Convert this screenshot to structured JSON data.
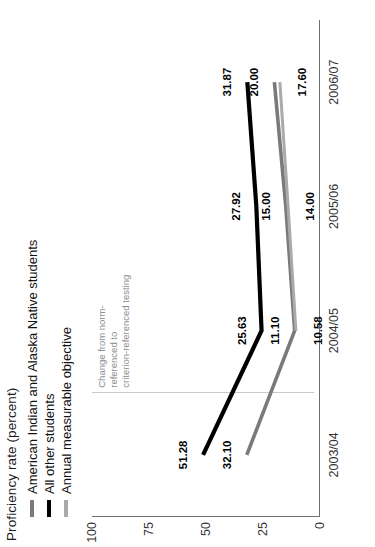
{
  "figure": {
    "title": "Proficiency rate (percent)"
  },
  "legend": {
    "position": "top-left",
    "items": [
      {
        "label": "American Indian and Alaska Native students",
        "color": "#7a7a7a",
        "swatch": "line-swatch"
      },
      {
        "label": "All other students",
        "color": "#000000",
        "swatch": "line-swatch"
      },
      {
        "label": "Annual measurable objective",
        "color": "#aaaaaa",
        "swatch": "line-swatch"
      }
    ]
  },
  "annotation": {
    "text": "Change from norm-referenced to\ncriterion-referenced testing",
    "divider_color": "#c9c9c9"
  },
  "axes": {
    "y_label": "Proficiency rate (percent)",
    "y_ticks": [
      "0",
      "25",
      "50",
      "75",
      "100"
    ],
    "x_ticks": [
      "2003/04",
      "2004/05",
      "2005/06",
      "2006/07"
    ]
  },
  "chart_data": {
    "type": "line",
    "title": "Proficiency rate (percent)",
    "xlabel": "",
    "ylabel": "Proficiency rate (percent)",
    "categories": [
      "2003/04",
      "2004/05",
      "2005/06",
      "2006/07"
    ],
    "ylim": [
      0,
      100
    ],
    "yticks": [
      0,
      25,
      50,
      75,
      100
    ],
    "grid": false,
    "legend_position": "top-left",
    "annotations": [
      {
        "text": "Change from norm-referenced to criterion-referenced testing",
        "type": "vertical-divider",
        "between": [
          "2003/04",
          "2004/05"
        ]
      }
    ],
    "series": [
      {
        "name": "All other students",
        "color": "#000000",
        "values": [
          51.28,
          25.63,
          27.92,
          31.87
        ],
        "labels": [
          "51.28",
          "25.63",
          "27.92",
          "31.87"
        ]
      },
      {
        "name": "American Indian and Alaska Native students",
        "color": "#7a7a7a",
        "values": [
          32.1,
          11.1,
          15.0,
          20.0
        ],
        "labels": [
          "32.10",
          "11.10",
          "15.00",
          "20.00"
        ]
      },
      {
        "name": "Annual measurable objective",
        "color": "#aaaaaa",
        "values": [
          null,
          10.58,
          14.0,
          17.6
        ],
        "labels": [
          "",
          "10.58",
          "14.00",
          "17.60"
        ]
      }
    ]
  }
}
